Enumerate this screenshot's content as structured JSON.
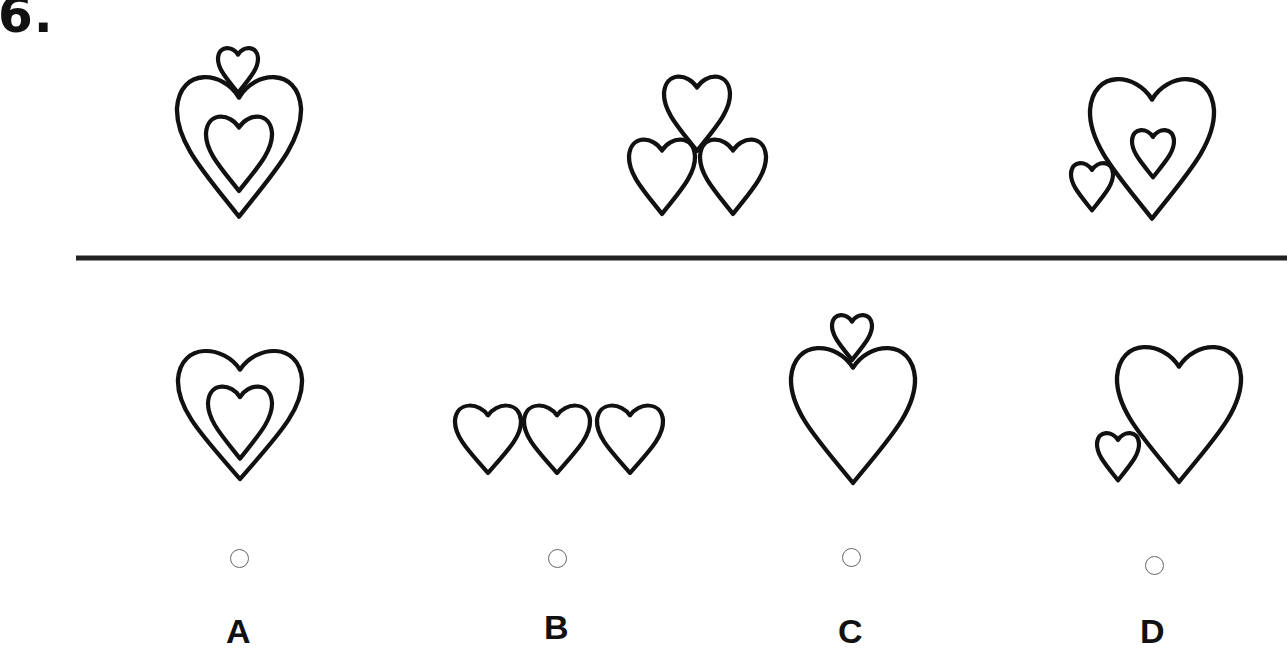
{
  "question": {
    "number": "6."
  },
  "colors": {
    "stroke": "#111111",
    "background": "#ffffff",
    "radio_border": "#666666"
  },
  "sequence_figures": [
    {
      "id": "seq-1",
      "description": "large heart containing smaller heart, small heart on top notch"
    },
    {
      "id": "seq-2",
      "description": "three hearts in triangular arrangement"
    },
    {
      "id": "seq-3",
      "description": "large heart containing small heart, small heart at lower-left outside"
    }
  ],
  "options": [
    {
      "letter": "A",
      "description": "large heart containing smaller heart"
    },
    {
      "letter": "B",
      "description": "three hearts in a row"
    },
    {
      "letter": "C",
      "description": "large heart with small heart on top notch"
    },
    {
      "letter": "D",
      "description": "large heart with small heart at lower-left"
    }
  ]
}
